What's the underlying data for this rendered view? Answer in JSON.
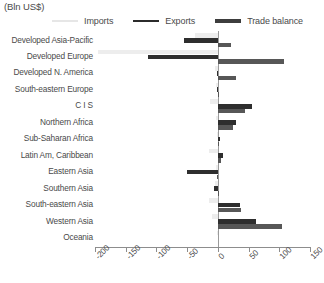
{
  "header": {
    "unit_title": "(Bln US$)"
  },
  "legend": {
    "position": "top",
    "items": [
      {
        "label": "Imports",
        "key": "imports",
        "color": "#ededed"
      },
      {
        "label": "Exports",
        "key": "exports",
        "color": "#2e2e2e"
      },
      {
        "label": "Trade balance",
        "key": "balance",
        "color": "#575757"
      }
    ]
  },
  "axis": {
    "ticks": [
      "-200",
      "-150",
      "-100",
      "-50",
      "0",
      "50",
      "100",
      "150"
    ],
    "min": -200,
    "max": 150,
    "step": 50,
    "orientation": "horizontal",
    "label_rotation": "-45"
  },
  "chart_data": {
    "type": "bar",
    "orientation": "horizontal",
    "title": "(Bln US$)",
    "xlabel": "",
    "ylabel": "",
    "xlim": [
      -200,
      150
    ],
    "grid": false,
    "legend_position": "top",
    "categories": [
      "Developed Asia-Pacific",
      "Developed Europe",
      "Developed N. America",
      "South-eastern Europe",
      "C I S",
      "Northern Africa",
      "Sub-Saharan Africa",
      "Latin Am, Caribbean",
      "Eastern Asia",
      "Southern Asia",
      "South-eastern Asia",
      "Western Asia",
      "Oceania"
    ],
    "series": [
      {
        "name": "Imports",
        "color": "#ededed",
        "values": [
          -37,
          -195,
          -5,
          -3,
          -13,
          -3,
          -2,
          -14,
          -3,
          -4,
          -15,
          -9,
          -1
        ]
      },
      {
        "name": "Exports",
        "color": "#2e2e2e",
        "values": [
          -55,
          -113,
          -2,
          -2,
          55,
          30,
          3,
          9,
          -50,
          -6,
          36,
          62,
          0
        ]
      },
      {
        "name": "Trade balance",
        "color": "#575757",
        "values": [
          21,
          108,
          29,
          1,
          45,
          24,
          2,
          5,
          -1,
          1,
          37,
          105,
          0
        ]
      }
    ]
  }
}
